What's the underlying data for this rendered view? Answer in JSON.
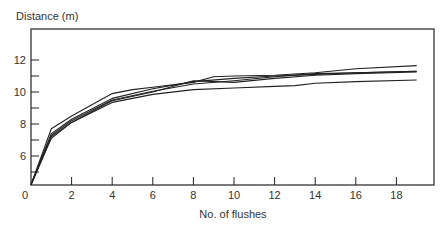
{
  "chart_data": {
    "type": "line",
    "title": "",
    "ylabel": "Distance (m)",
    "xlabel": "No. of flushes",
    "xlim": [
      0,
      19.8
    ],
    "ylim": [
      4.2,
      13.9
    ],
    "xticks": [
      0,
      2,
      4,
      6,
      8,
      10,
      12,
      14,
      16,
      18
    ],
    "yticks_major": [
      6,
      8,
      10,
      12
    ],
    "yticks_minor": [
      5,
      7,
      9,
      11
    ],
    "grid": false,
    "legend": null,
    "line_color": "#222222",
    "series": [
      {
        "name": "Series 1",
        "x": [
          0,
          1,
          2,
          4,
          5,
          6,
          8,
          9,
          10,
          12,
          14,
          16,
          19
        ],
        "values": [
          4.2,
          7.7,
          8.5,
          9.9,
          10.15,
          10.3,
          10.6,
          10.95,
          11.0,
          11.05,
          11.2,
          11.45,
          11.65
        ]
      },
      {
        "name": "Series 2",
        "x": [
          0,
          1,
          2,
          4,
          6,
          8,
          10,
          12,
          14,
          16,
          19
        ],
        "values": [
          4.2,
          7.4,
          8.3,
          9.6,
          10.2,
          10.65,
          10.85,
          11.0,
          11.1,
          11.2,
          11.3
        ]
      },
      {
        "name": "Series 3",
        "x": [
          0,
          1,
          2,
          4,
          6,
          8,
          10,
          12,
          14,
          16,
          19
        ],
        "values": [
          4.2,
          7.3,
          8.2,
          9.5,
          10.05,
          10.5,
          10.7,
          10.95,
          11.15,
          11.2,
          11.3
        ]
      },
      {
        "name": "Series 4",
        "x": [
          0,
          1,
          2,
          4,
          6,
          8,
          10,
          12,
          14,
          16,
          19
        ],
        "values": [
          4.2,
          7.2,
          8.1,
          9.45,
          10.0,
          10.7,
          10.6,
          10.85,
          11.05,
          11.15,
          11.25
        ]
      },
      {
        "name": "Series 5",
        "x": [
          0,
          1,
          2,
          4,
          6,
          8,
          10,
          12,
          13,
          14,
          16,
          19
        ],
        "values": [
          4.2,
          7.1,
          8.1,
          9.35,
          9.85,
          10.15,
          10.25,
          10.35,
          10.4,
          10.55,
          10.65,
          10.75
        ]
      }
    ]
  },
  "labels": {
    "y_axis_title": "Distance (m)",
    "x_axis_title": "No. of flushes",
    "x_origin": "0"
  }
}
